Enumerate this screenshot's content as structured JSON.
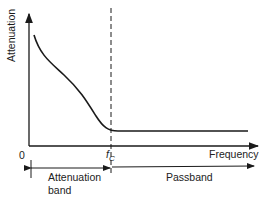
{
  "diagram": {
    "y_axis_label": "Attenuation",
    "x_axis_label": "Frequency",
    "origin_label": "0",
    "cutoff_label": "f",
    "cutoff_subscript": "C",
    "bands": [
      {
        "label_line1": "Attenuation",
        "label_line2": "band"
      },
      {
        "label_line1": "Passband"
      }
    ],
    "colors": {
      "line": "#1a1a1a",
      "background": "#ffffff"
    }
  }
}
